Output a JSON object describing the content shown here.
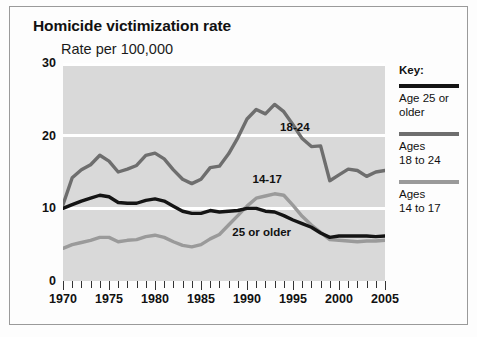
{
  "chart_data": {
    "type": "line",
    "title": "Homicide victimization rate",
    "subtitle": "Rate per 100,000",
    "xlabel": "",
    "ylabel": "Rate per 100,000",
    "xlim": [
      1970,
      2005
    ],
    "ylim": [
      0,
      30
    ],
    "yticks": [
      0,
      10,
      20,
      30
    ],
    "xticks": [
      1970,
      1975,
      1980,
      1985,
      1990,
      1995,
      2000,
      2005
    ],
    "xtick_labels": [
      "1970",
      "1975",
      "1980",
      "1985",
      "1990",
      "1995",
      "2000",
      "2005"
    ],
    "ytick_labels": [
      "0",
      "10",
      "20",
      "30"
    ],
    "grid": true,
    "legend_position": "right",
    "x": [
      1970,
      1971,
      1972,
      1973,
      1974,
      1975,
      1976,
      1977,
      1978,
      1979,
      1980,
      1981,
      1982,
      1983,
      1984,
      1985,
      1986,
      1987,
      1988,
      1989,
      1990,
      1991,
      1992,
      1993,
      1994,
      1995,
      1996,
      1997,
      1998,
      1999,
      2000,
      2001,
      2002,
      2003,
      2004,
      2005
    ],
    "series": [
      {
        "name": "Ages 18 to 24",
        "label": "18-24",
        "color": "#6e6e6e",
        "values": [
          10.5,
          14.2,
          15.3,
          16.0,
          17.3,
          16.5,
          15.0,
          15.4,
          15.9,
          17.3,
          17.6,
          16.8,
          15.3,
          14.0,
          13.4,
          14.0,
          15.6,
          15.8,
          17.5,
          19.7,
          22.3,
          23.6,
          23.0,
          24.3,
          23.3,
          21.5,
          19.6,
          18.5,
          18.6,
          13.8,
          14.6,
          15.4,
          15.2,
          14.4,
          15.0,
          15.2
        ]
      },
      {
        "name": "Age 25 or older",
        "label": "25 or older",
        "color": "#141414",
        "values": [
          10.0,
          10.5,
          11.0,
          11.4,
          11.8,
          11.6,
          10.8,
          10.7,
          10.7,
          11.1,
          11.3,
          11.0,
          10.3,
          9.6,
          9.3,
          9.3,
          9.7,
          9.5,
          9.6,
          9.7,
          10.0,
          10.0,
          9.6,
          9.5,
          9.0,
          8.4,
          7.9,
          7.4,
          6.6,
          6.0,
          6.2,
          6.2,
          6.2,
          6.2,
          6.1,
          6.2
        ]
      },
      {
        "name": "Ages 14 to 17",
        "label": "14-17",
        "color": "#9a9a9a",
        "values": [
          4.5,
          5.0,
          5.3,
          5.6,
          6.0,
          6.0,
          5.4,
          5.6,
          5.7,
          6.1,
          6.3,
          6.0,
          5.4,
          4.9,
          4.7,
          5.0,
          5.8,
          6.4,
          7.7,
          9.0,
          10.3,
          11.4,
          11.7,
          12.0,
          11.8,
          10.4,
          8.9,
          7.7,
          6.7,
          5.7,
          5.6,
          5.5,
          5.4,
          5.5,
          5.5,
          5.6
        ]
      }
    ],
    "annotations": [
      {
        "text": "18-24",
        "x": 1993.6,
        "y": 21.0
      },
      {
        "text": "14-17",
        "x": 1990.6,
        "y": 13.9
      },
      {
        "text": "25 or older",
        "x": 1988.4,
        "y": 6.6
      }
    ]
  },
  "legend": {
    "title": "Key:",
    "entries": [
      {
        "label_line1": "Age 25 or",
        "label_line2": "older",
        "color": "#141414"
      },
      {
        "label_line1": "Ages",
        "label_line2": "18 to 24",
        "color": "#6e6e6e"
      },
      {
        "label_line1": "Ages",
        "label_line2": "14 to 17",
        "color": "#9a9a9a"
      }
    ]
  },
  "colors": {
    "plot_background": "#d9d9d9",
    "gridline": "#ffffff",
    "frame_border": "#9a9a9a",
    "page_background": "#fdfdfd",
    "text": "#111111"
  }
}
